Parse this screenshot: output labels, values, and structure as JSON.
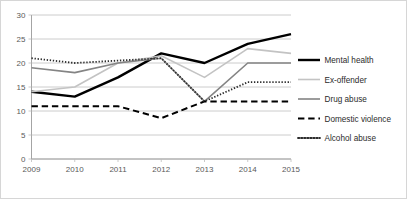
{
  "chart_data": {
    "type": "line",
    "title": "",
    "xlabel": "",
    "ylabel": "",
    "categories": [
      "2009",
      "2010",
      "2011",
      "2012",
      "2013",
      "2014",
      "2015"
    ],
    "x": [
      2009,
      2010,
      2011,
      2012,
      2013,
      2014,
      2015
    ],
    "ylim": [
      0,
      30
    ],
    "yticks": [
      0,
      5,
      10,
      15,
      20,
      25,
      30
    ],
    "ytick_labels": [
      "0",
      "5",
      "10",
      "15",
      "20",
      "25",
      "30"
    ],
    "grid": true,
    "legend_position": "right",
    "series": [
      {
        "name": "Mental health",
        "values": [
          14,
          13,
          17,
          22,
          20,
          24,
          26
        ],
        "color": "#000000",
        "style": "solid",
        "width": 2.4
      },
      {
        "name": "Ex-offender",
        "values": [
          14,
          15,
          20,
          21.5,
          17,
          23,
          22
        ],
        "color": "#c3c3c3",
        "style": "solid",
        "width": 1.6
      },
      {
        "name": "Drug abuse",
        "values": [
          19,
          18,
          20,
          21,
          12,
          20,
          20
        ],
        "color": "#848484",
        "style": "solid",
        "width": 1.6
      },
      {
        "name": "Domestic violence",
        "values": [
          11,
          11,
          11,
          8.5,
          12,
          12,
          12
        ],
        "color": "#000000",
        "style": "dashed",
        "width": 2.0
      },
      {
        "name": "Alcohol abuse",
        "values": [
          21,
          20,
          20.5,
          21,
          12,
          16,
          16
        ],
        "color": "#2b2b2b",
        "style": "dotted",
        "width": 1.8
      }
    ]
  },
  "legend": {
    "items": [
      {
        "label": "Mental health"
      },
      {
        "label": "Ex-offender"
      },
      {
        "label": "Drug abuse"
      },
      {
        "label": "Domestic violence"
      },
      {
        "label": "Alcohol abuse"
      }
    ]
  },
  "axes": {
    "y_tick_labels": [
      "30",
      "25",
      "20",
      "15",
      "10",
      "5",
      "0"
    ],
    "x_tick_labels": [
      "2009",
      "2010",
      "2011",
      "2012",
      "2013",
      "2014",
      "2015"
    ]
  }
}
